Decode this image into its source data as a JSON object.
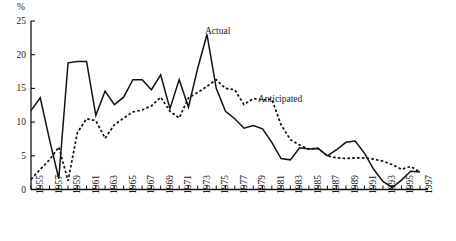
{
  "chart_data": {
    "type": "line",
    "title": "",
    "subtitle": "",
    "xlabel": "",
    "ylabel": "%",
    "ylim": [
      0,
      25
    ],
    "xlim": [
      1955,
      1997
    ],
    "yticks": [
      0,
      5,
      10,
      15,
      20,
      25
    ],
    "grid": false,
    "legend_position": "inline-annotation",
    "annotations": [
      {
        "text": "Actual",
        "x": 1974,
        "y": 24.5
      },
      {
        "text": "Anticipated",
        "x": 1983,
        "y": 17.5
      }
    ],
    "x": [
      1955,
      1956,
      1957,
      1958,
      1959,
      1960,
      1961,
      1962,
      1963,
      1964,
      1965,
      1966,
      1967,
      1968,
      1969,
      1970,
      1971,
      1972,
      1973,
      1974,
      1975,
      1976,
      1977,
      1978,
      1979,
      1980,
      1981,
      1982,
      1983,
      1984,
      1985,
      1986,
      1987,
      1988,
      1989,
      1990,
      1991,
      1992,
      1993,
      1994,
      1995,
      1996,
      1997
    ],
    "xtick_labels": [
      "1955",
      "1957",
      "1959",
      "1961",
      "1963",
      "1965",
      "1967",
      "1969",
      "1971",
      "1973",
      "1975",
      "1977",
      "1979",
      "1981",
      "1983",
      "1985",
      "1987",
      "1989",
      "1991",
      "1993",
      "1995",
      "1997"
    ],
    "series": [
      {
        "name": "Actual",
        "style": "solid",
        "color": "#111111",
        "values": [
          11.7,
          13.6,
          7.4,
          1.6,
          18.8,
          19.0,
          19.0,
          11.0,
          14.6,
          12.6,
          13.7,
          16.3,
          16.3,
          14.8,
          17.0,
          12.0,
          16.3,
          12.2,
          18.0,
          23.0,
          15.0,
          11.6,
          10.5,
          9.1,
          9.5,
          9.0,
          7.0,
          4.6,
          4.4,
          6.2,
          6.0,
          6.1,
          5.0,
          5.9,
          7.0,
          7.2,
          5.4,
          3.0,
          1.2,
          0.3,
          1.4,
          2.7,
          2.6
        ]
      },
      {
        "name": "Anticipated",
        "style": "dotted",
        "color": "#111111",
        "values": [
          1.5,
          3.0,
          4.4,
          6.3,
          1.3,
          8.4,
          10.5,
          10.2,
          7.6,
          9.6,
          10.6,
          11.5,
          11.8,
          12.4,
          13.7,
          11.6,
          10.6,
          13.6,
          14.4,
          15.3,
          16.3,
          15.0,
          14.8,
          12.6,
          13.5,
          13.3,
          13.4,
          9.6,
          7.4,
          6.6,
          6.0,
          6.1,
          5.0,
          4.7,
          4.6,
          4.7,
          4.7,
          4.5,
          4.2,
          3.7,
          3.0,
          3.4,
          2.6
        ]
      }
    ]
  }
}
